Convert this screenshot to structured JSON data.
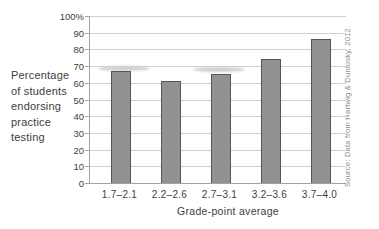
{
  "chart_data": {
    "type": "bar",
    "title": "",
    "categories": [
      "1.7–2.1",
      "2.2–2.6",
      "2.7–3.1",
      "3.2–3.6",
      "3.7–4.0"
    ],
    "values": [
      67,
      61,
      65,
      74,
      86
    ],
    "xlabel": "Grade-point average",
    "ylabel": "Percentage of students endorsing practice testing",
    "ylabel_lines": [
      "Percentage",
      "of students",
      "endorsing",
      "practice",
      "testing"
    ],
    "ylim": [
      0,
      100
    ],
    "ytick_step": 10,
    "ytick_labels": [
      "0",
      "10",
      "20",
      "30",
      "40",
      "50",
      "60",
      "70",
      "80",
      "90",
      "100%"
    ],
    "grid": true,
    "legend": "none",
    "bar_color": "#929292",
    "bar_border_color": "#565656",
    "gridline_color": "#d0d0d0",
    "axis_color": "#a3a3a3",
    "text_color": "#3d3d3d",
    "source_text_color": "#8c8c8c"
  },
  "source": "Source: Data from Hartwig & Dunlosky, 2012."
}
